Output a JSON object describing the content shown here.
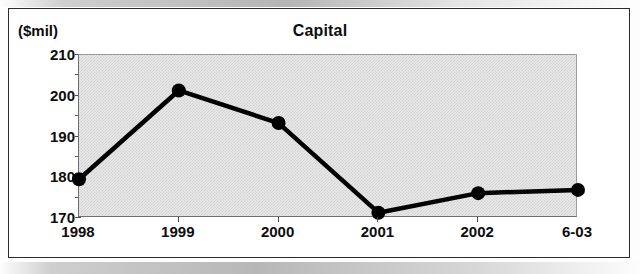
{
  "chart_data": {
    "type": "line",
    "title": "Capital",
    "units_label": "($mil)",
    "xlabel": "",
    "ylabel": "($mil)",
    "categories": [
      "1998",
      "1999",
      "2000",
      "2001",
      "2002",
      "6-03"
    ],
    "values": [
      179.5,
      201.3,
      193.3,
      171.3,
      176.1,
      176.9
    ],
    "series": [
      {
        "name": "Capital",
        "values": [
          179.5,
          201.3,
          193.3,
          171.3,
          176.1,
          176.9
        ]
      }
    ],
    "ylim": [
      170,
      210
    ],
    "y_major_ticks": [
      170,
      180,
      190,
      200,
      210
    ],
    "y_minor_tick_interval": 5,
    "y_tick_labels": [
      "210",
      "200",
      "190",
      "180",
      "170"
    ],
    "grid": false,
    "legend": false,
    "legend_position": "none",
    "plot_background": "#e9e9e9",
    "line_color": "#000000",
    "marker_color": "#000000",
    "marker_shape": "circle",
    "frame_color": "#2b2b2b"
  },
  "chart": {
    "title": "Capital",
    "units": "($mil)"
  }
}
